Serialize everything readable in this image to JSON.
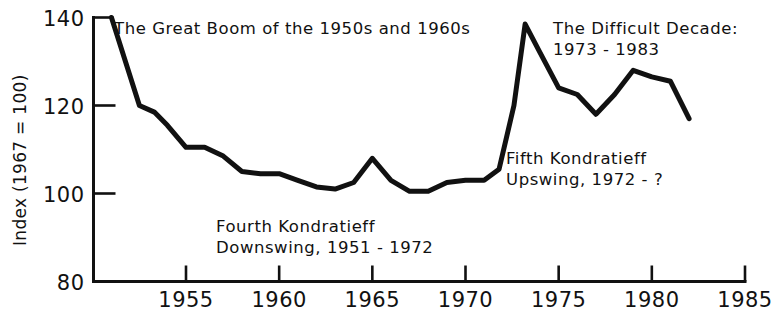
{
  "chart_data": {
    "type": "line",
    "title": "",
    "xlabel": "",
    "ylabel": "Index (1967 = 100)",
    "xlim": [
      1951,
      1985
    ],
    "ylim": [
      80,
      140
    ],
    "grid": false,
    "legend": null,
    "xticks": [
      "1955",
      "1960",
      "1965",
      "1970",
      "1975",
      "1980",
      "1985"
    ],
    "xtick_values": [
      1955,
      1960,
      1965,
      1970,
      1975,
      1980,
      1985
    ],
    "yticks": [
      "80",
      "100",
      "120",
      "140"
    ],
    "ytick_values": [
      80,
      100,
      120,
      140
    ],
    "series": [
      {
        "name": "Index (1967 = 100)",
        "x": [
          1951.0,
          1952.5,
          1953.3,
          1954.0,
          1955.0,
          1956.0,
          1957.0,
          1958.0,
          1959.0,
          1960.0,
          1961.0,
          1962.0,
          1963.0,
          1964.0,
          1965.0,
          1966.0,
          1967.0,
          1968.0,
          1969.0,
          1970.0,
          1971.0,
          1971.8,
          1972.6,
          1973.2,
          1974.0,
          1975.0,
          1976.0,
          1977.0,
          1978.0,
          1979.0,
          1980.0,
          1981.0,
          1982.0
        ],
        "values": [
          140.0,
          120.0,
          118.5,
          115.5,
          110.5,
          110.5,
          108.5,
          105.0,
          104.5,
          104.5,
          103.0,
          101.5,
          101.0,
          102.5,
          108.0,
          103.0,
          100.5,
          100.5,
          102.5,
          103.0,
          103.0,
          105.5,
          120.0,
          138.5,
          132.0,
          124.0,
          122.5,
          118.0,
          122.5,
          128.0,
          126.5,
          125.5,
          117.0
        ]
      }
    ],
    "annotations": [
      {
        "name": "great-boom-label",
        "text": "The Great Boom of the 1950s and 1960s",
        "x_px": 114,
        "y_px": 18
      },
      {
        "name": "difficult-decade-label",
        "text": "The Difficult Decade:\n1973 - 1983",
        "x_px": 553,
        "y_px": 18
      },
      {
        "name": "fourth-kondratieff-label",
        "text": "Fourth Kondratieff\nDownswing, 1951 - 1972",
        "x_px": 216,
        "y_px": 216
      },
      {
        "name": "fifth-kondratieff-label",
        "text": "Fifth Kondratieff\nUpswing, 1972 - ?",
        "x_px": 506,
        "y_px": 148
      }
    ],
    "colors": {
      "line": "#111111",
      "axis": "#111111",
      "background": "#ffffff"
    }
  }
}
